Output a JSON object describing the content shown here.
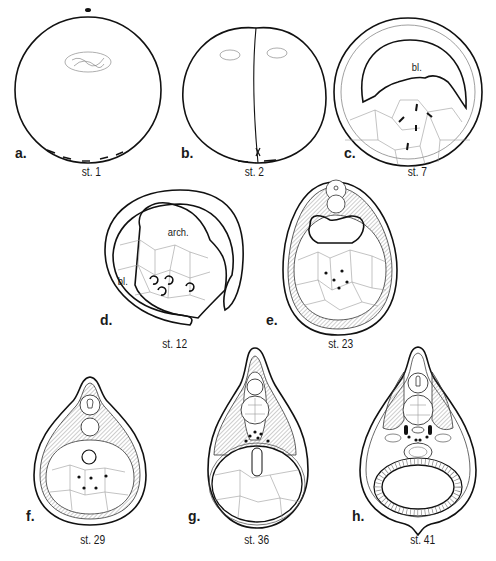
{
  "figure": {
    "panels": [
      {
        "id": "a",
        "label": "a.",
        "stage": "st. 1",
        "annotations": []
      },
      {
        "id": "b",
        "label": "b.",
        "stage": "st. 2",
        "annotations": []
      },
      {
        "id": "c",
        "label": "c.",
        "stage": "st. 7",
        "annotations": [
          "bl."
        ]
      },
      {
        "id": "d",
        "label": "d.",
        "stage": "st. 12",
        "annotations": [
          "arch.",
          "bl."
        ]
      },
      {
        "id": "e",
        "label": "e.",
        "stage": "st. 23",
        "annotations": []
      },
      {
        "id": "f",
        "label": "f.",
        "stage": "st. 29",
        "annotations": []
      },
      {
        "id": "g",
        "label": "g.",
        "stage": "st. 36",
        "annotations": []
      },
      {
        "id": "h",
        "label": "h.",
        "stage": "st. 41",
        "annotations": []
      }
    ]
  }
}
